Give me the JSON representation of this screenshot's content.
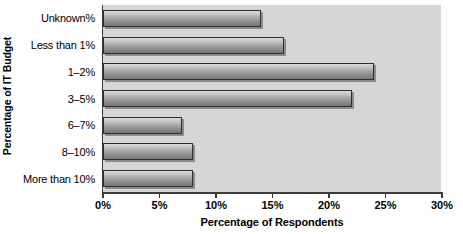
{
  "chart_data": {
    "type": "bar",
    "orientation": "horizontal",
    "title": "",
    "xlabel": "Percentage of Respondents",
    "ylabel": "Percentage of IT Budget",
    "categories": [
      "Unknown%",
      "Less than 1%",
      "1–2%",
      "3–5%",
      "6–7%",
      "8–10%",
      "More than 10%"
    ],
    "values": [
      14,
      16,
      24,
      22,
      7,
      8,
      8
    ],
    "xlim": [
      0,
      30
    ],
    "xticks": [
      0,
      5,
      10,
      15,
      20,
      25,
      30
    ],
    "xtick_labels": [
      "0%",
      "5%",
      "10%",
      "15%",
      "20%",
      "25%",
      "30%"
    ],
    "grid": false,
    "legend": null,
    "plot_background_color": "#d6d6d6",
    "bar_fill_top_color": "#d9d9d9",
    "bar_fill_bottom_color": "#787878",
    "bar_border_color": "#2e2e2e",
    "axis_color": "#3a3a3a",
    "text_color": "#000000"
  }
}
